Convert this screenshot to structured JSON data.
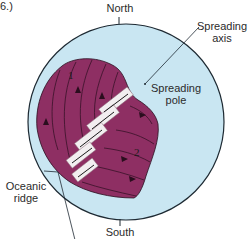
{
  "figure": {
    "caption_fragment": "6.)",
    "labels": {
      "north": "North",
      "south": "South",
      "spreading_axis_line1": "Spreading",
      "spreading_axis_line2": "axis",
      "spreading_pole_line1": "Spreading",
      "spreading_pole_line2": "pole",
      "oceanic_ridge_line1": "Oceanic",
      "oceanic_ridge_line2": "ridge",
      "plate_1": "1",
      "plate_2": "2"
    },
    "colors": {
      "globe_fill": "#c9e6f2",
      "globe_stroke": "#1e2a33",
      "plate_fill": "#8e2f63",
      "plate_line": "#2a0e1e",
      "ridge_fill": "#f2eef0",
      "ridge_hatch": "#8a6a78",
      "ridge_accent": "#e8a0b0",
      "text": "#2b2b2b"
    }
  }
}
